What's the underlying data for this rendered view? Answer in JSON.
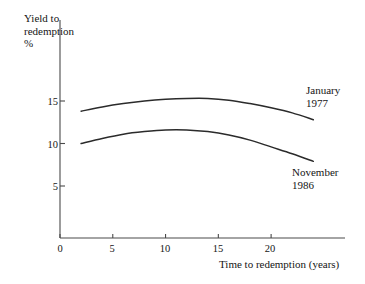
{
  "chart_data": {
    "type": "line",
    "title": "",
    "xlabel": "Time to redemption (years)",
    "ylabel": "Yield to\nredemption\n%",
    "xlim": [
      0,
      27
    ],
    "ylim": [
      0,
      17.5
    ],
    "grid": false,
    "legend_position": "inline-right-of-curves",
    "xticks": [
      0,
      5,
      10,
      15,
      20
    ],
    "xtick_labels": [
      "0",
      "5",
      "10",
      "15",
      "20"
    ],
    "yticks": [
      5,
      10,
      15
    ],
    "ytick_labels": [
      "5",
      "10",
      "15"
    ],
    "line_color": "#2b2b2b",
    "axis_color": "#4a4a4a",
    "series": [
      {
        "name": "January\n1977",
        "label_line1": "January",
        "label_line2": "1977",
        "x": [
          2,
          4,
          6,
          8,
          10,
          12,
          14,
          16,
          18,
          20,
          22,
          24
        ],
        "values": [
          13.8,
          14.3,
          14.7,
          15.0,
          15.2,
          15.3,
          15.3,
          15.1,
          14.7,
          14.2,
          13.6,
          12.8
        ]
      },
      {
        "name": "November\n1986",
        "label_line1": "November",
        "label_line2": "1986",
        "x": [
          2,
          4,
          6,
          8,
          10,
          12,
          14,
          16,
          18,
          20,
          22,
          24
        ],
        "values": [
          10.0,
          10.6,
          11.1,
          11.4,
          11.6,
          11.6,
          11.4,
          11.0,
          10.4,
          9.6,
          8.8,
          7.9
        ]
      }
    ]
  },
  "axes": {
    "y_title": "Yield to\nredemption\n%",
    "x_title": "Time to redemption (years)"
  }
}
